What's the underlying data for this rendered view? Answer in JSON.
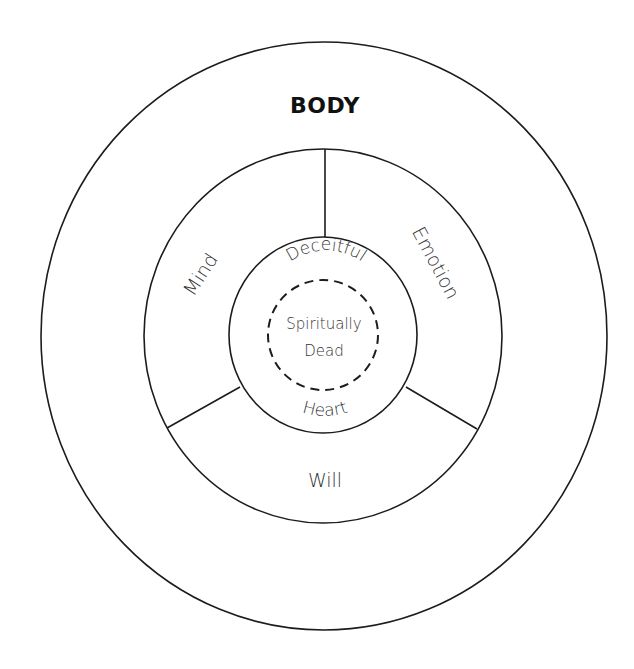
{
  "diagram": {
    "title": "BODY",
    "layers": {
      "outer": {
        "label": "BODY"
      },
      "middle": {
        "segments": [
          {
            "id": "mind",
            "label": "Mind"
          },
          {
            "id": "emotion",
            "label": "Emotion"
          },
          {
            "id": "will",
            "label": "Will"
          }
        ]
      },
      "inner": {
        "top_label": "Deceitful",
        "bottom_label": "Heart"
      },
      "core": {
        "line1": "Spiritually",
        "line2": "Dead",
        "style": "dashed"
      }
    },
    "colors": {
      "stroke": "#1c1c1c",
      "text": "#333333",
      "background": "#ffffff"
    }
  }
}
